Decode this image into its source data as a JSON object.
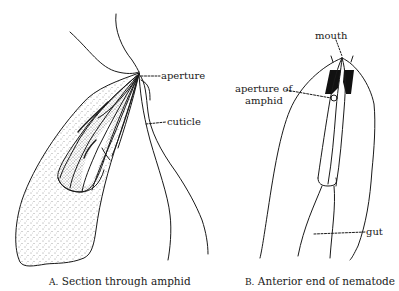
{
  "figure_a": {
    "caption_letter": "A.",
    "caption_text": "Section through amphid",
    "labels": {
      "aperture": "aperture",
      "cuticle": "cuticle"
    }
  },
  "figure_b": {
    "caption_letter": "B.",
    "caption_text": "Anterior end of nematode",
    "labels": {
      "mouth": "mouth",
      "aperture_of_amphid_line1": "aperture of",
      "aperture_of_amphid_line2": "amphid",
      "gut": "gut"
    }
  },
  "colors": {
    "ink": "#1a1a1a",
    "background": "#ffffff"
  }
}
